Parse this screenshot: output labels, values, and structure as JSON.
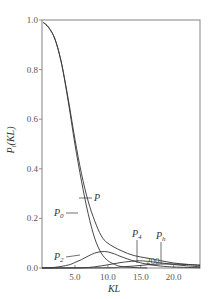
{
  "chart_data": {
    "type": "line",
    "title": "",
    "xlabel": "KL",
    "ylabel": "P_i(KL)",
    "xlim": [
      0,
      24
    ],
    "ylim": [
      0,
      1.0
    ],
    "x_ticks": [
      "5.0",
      "10.0",
      "15.0",
      "20.0"
    ],
    "x_tick_values": [
      5,
      10,
      15,
      20
    ],
    "y_ticks": [
      "0.0",
      "0.2",
      "0.4",
      "0.6",
      "0.8",
      "1.0"
    ],
    "y_tick_values": [
      0,
      0.2,
      0.4,
      0.6,
      0.8,
      1.0
    ],
    "grid": false,
    "legend": "inline labels",
    "series": [
      {
        "name": "P",
        "label_main": "P",
        "label_sub": "",
        "x": [
          0.2,
          1,
          2,
          3,
          4,
          5,
          6,
          7,
          8,
          9,
          10,
          12,
          14,
          16,
          18,
          20,
          22,
          24
        ],
        "values": [
          0.99,
          0.97,
          0.92,
          0.82,
          0.68,
          0.52,
          0.38,
          0.27,
          0.19,
          0.13,
          0.1,
          0.07,
          0.05,
          0.04,
          0.03,
          0.02,
          0.015,
          0.01
        ]
      },
      {
        "name": "P0",
        "label_main": "P",
        "label_sub": "0",
        "x": [
          0.2,
          1,
          2,
          3,
          4,
          5,
          6,
          7,
          8,
          9,
          10,
          11,
          12,
          14,
          16
        ],
        "values": [
          0.99,
          0.97,
          0.92,
          0.82,
          0.67,
          0.5,
          0.35,
          0.22,
          0.12,
          0.06,
          0.03,
          0.015,
          0.006,
          0.002,
          0.0
        ]
      },
      {
        "name": "P2",
        "label_main": "P",
        "label_sub": "2",
        "x": [
          0,
          2,
          4,
          5,
          6,
          7,
          8,
          9,
          10,
          11,
          12,
          14,
          16,
          18,
          20,
          24
        ],
        "values": [
          0.0,
          0.003,
          0.012,
          0.022,
          0.034,
          0.048,
          0.06,
          0.066,
          0.065,
          0.057,
          0.046,
          0.028,
          0.015,
          0.008,
          0.004,
          0.001
        ]
      },
      {
        "name": "P4",
        "label_main": "P",
        "label_sub": "4",
        "x": [
          0,
          6,
          8,
          10,
          12,
          14,
          15,
          16,
          18,
          20,
          22,
          24
        ],
        "values": [
          0.0,
          0.001,
          0.005,
          0.013,
          0.022,
          0.028,
          0.029,
          0.027,
          0.021,
          0.014,
          0.009,
          0.005
        ]
      },
      {
        "name": "Ph",
        "label_main": "P",
        "label_sub": "h",
        "x": [
          0,
          10,
          12,
          14,
          16,
          18,
          20,
          22,
          24
        ],
        "values": [
          0.0,
          0.001,
          0.004,
          0.008,
          0.013,
          0.016,
          0.016,
          0.014,
          0.012
        ]
      }
    ],
    "annotations": [
      {
        "text": "P",
        "x": 10.5,
        "y": 0.28
      },
      {
        "text": "P0",
        "x": 4.0,
        "y": 0.21
      },
      {
        "text": "P2",
        "x": 4.0,
        "y": 0.05
      },
      {
        "text": "P4",
        "x": 14.5,
        "y": 0.1
      },
      {
        "text": "Ph",
        "x": 19.8,
        "y": 0.09
      },
      {
        "text": "200",
        "x": 18.0,
        "y": 0.02
      }
    ]
  },
  "labels": {
    "xlabel": "KL",
    "ylabel_main": "P",
    "ylabel_sub": "i",
    "ylabel_rest": "(KL)",
    "curve_annotation": "200"
  }
}
